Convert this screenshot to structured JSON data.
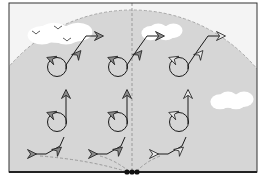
{
  "diagram": {
    "type": "flight-pattern-illustration",
    "frame": {
      "x": 9,
      "y": 3,
      "w": 248,
      "h": 169,
      "bg": "#f4f4f4",
      "border": "#333333"
    },
    "fan": {
      "cx": 132,
      "cy": 172,
      "r": 162,
      "fill": "#d6d6d6",
      "edge": "#a8a8a8"
    },
    "colors": {
      "stroke": "#1a1a1a",
      "arrow_dark": "#8a8a8a",
      "arrow_light": "#e8e8e8",
      "cloud": "#ffffff",
      "dash": "#9a9a9a"
    },
    "clouds": [
      {
        "x": 30,
        "y": 22,
        "w": 60,
        "h": 22
      },
      {
        "x": 143,
        "y": 23,
        "w": 38,
        "h": 17
      },
      {
        "x": 212,
        "y": 91,
        "w": 40,
        "h": 18
      }
    ],
    "birds": [
      {
        "x": 36,
        "y": 33
      },
      {
        "x": 58,
        "y": 28
      },
      {
        "x": 67,
        "y": 40
      }
    ],
    "observer_dots": {
      "x": 132,
      "y": 172,
      "count": 3
    },
    "patterns": [
      {
        "name": "left",
        "x": 70,
        "filled": true
      },
      {
        "name": "center",
        "x": 131,
        "filled": true
      },
      {
        "name": "right",
        "x": 192,
        "filled": false
      }
    ]
  }
}
